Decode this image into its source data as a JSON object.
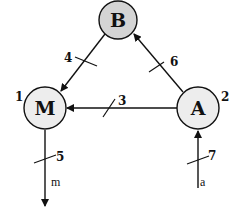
{
  "diagram": {
    "nodes": [
      {
        "id": "B",
        "label": "B",
        "number": "",
        "fill": "#d4d4d4"
      },
      {
        "id": "M",
        "label": "M",
        "number": "1",
        "fill": "#ededed"
      },
      {
        "id": "A",
        "label": "A",
        "number": "2",
        "fill": "#ededed"
      }
    ],
    "edges": [
      {
        "from": "A",
        "to": "M",
        "label": "3"
      },
      {
        "from": "B",
        "to": "M",
        "label": "4"
      },
      {
        "from": "M",
        "to": "out",
        "label": "5",
        "signal": "m"
      },
      {
        "from": "A",
        "to": "B",
        "label": "6"
      },
      {
        "from": "in",
        "to": "A",
        "label": "7",
        "signal": "a"
      }
    ],
    "stroke_color": "#111111"
  }
}
